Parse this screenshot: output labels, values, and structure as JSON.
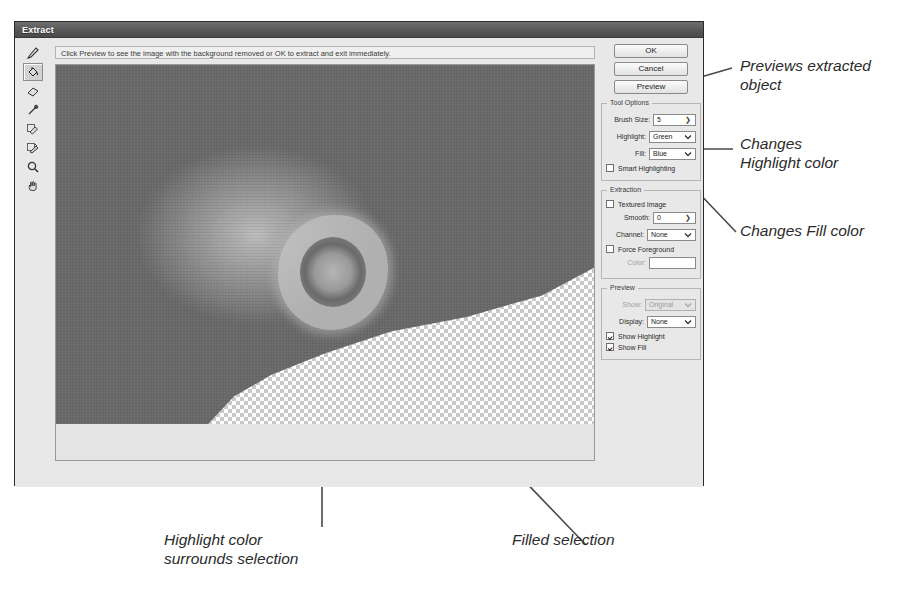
{
  "dialog": {
    "title": "Extract",
    "hint": "Click Preview to see the image with the background removed or OK to extract and exit immediately.",
    "buttons": [
      {
        "name": "ok",
        "label": "OK"
      },
      {
        "name": "cancel",
        "label": "Cancel"
      },
      {
        "name": "preview",
        "label": "Preview"
      }
    ]
  },
  "toolbar": {
    "tools": [
      {
        "name": "edge-highlighter-tool",
        "icon": "marker-pen-icon",
        "selected": false
      },
      {
        "name": "fill-tool",
        "icon": "paint-bucket-icon",
        "selected": true
      },
      {
        "name": "eraser-tool",
        "icon": "eraser-icon",
        "selected": false
      },
      {
        "name": "eyedropper-tool",
        "icon": "eyedropper-icon",
        "selected": false
      },
      {
        "name": "cleanup-tool",
        "icon": "cleanup-brush-icon",
        "selected": false
      },
      {
        "name": "edge-touchup-tool",
        "icon": "edge-touchup-icon",
        "selected": false
      },
      {
        "name": "zoom-tool",
        "icon": "magnifier-icon",
        "selected": false
      },
      {
        "name": "hand-tool",
        "icon": "hand-icon",
        "selected": false
      }
    ]
  },
  "tool_options": {
    "group_label": "Tool Options",
    "brush_size": {
      "label": "Brush Size:",
      "value": "5"
    },
    "highlight": {
      "label": "Highlight:",
      "value": "Green"
    },
    "fill": {
      "label": "Fill:",
      "value": "Blue"
    },
    "smart_highlighting": {
      "label": "Smart Highlighting",
      "checked": false
    }
  },
  "extraction": {
    "group_label": "Extraction",
    "textured_image": {
      "label": "Textured Image",
      "checked": false
    },
    "smooth": {
      "label": "Smooth:",
      "value": "0"
    },
    "channel": {
      "label": "Channel:",
      "value": "None"
    },
    "force_foreground": {
      "label": "Force Foreground",
      "checked": false
    },
    "color": {
      "label": "Color:",
      "value": ""
    }
  },
  "preview": {
    "group_label": "Preview",
    "show": {
      "label": "Show:",
      "value": "Original",
      "disabled": true
    },
    "display": {
      "label": "Display:",
      "value": "None"
    },
    "show_highlight": {
      "label": "Show Highlight",
      "checked": true
    },
    "show_fill": {
      "label": "Show Fill",
      "checked": true
    }
  },
  "annotations": [
    {
      "name": "annotation-previews-extracted-object",
      "text": "Previews extracted\nobject"
    },
    {
      "name": "annotation-changes-highlight-color",
      "text": "Changes\nHighlight color"
    },
    {
      "name": "annotation-changes-fill-color",
      "text": "Changes Fill color"
    },
    {
      "name": "annotation-highlight-surrounds-selection",
      "text": "Highlight color\nsurrounds selection"
    },
    {
      "name": "annotation-filled-selection",
      "text": "Filled selection"
    }
  ],
  "colors": {
    "dialog_bg": "#e8e8e8",
    "title_bar": "#5a5a5a",
    "border": "#8a8a8a",
    "annotation_text": "#2b2b2b",
    "leader_line": "#4a4a4a"
  }
}
